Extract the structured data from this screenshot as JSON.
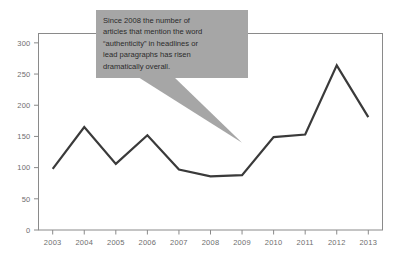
{
  "chart_data": {
    "type": "line",
    "title": "",
    "subtitle": "",
    "xlabel": "",
    "ylabel": "",
    "categories": [
      "2003",
      "2004",
      "2005",
      "2006",
      "2007",
      "2008",
      "2009",
      "2010",
      "2011",
      "2012",
      "2013"
    ],
    "values": [
      98,
      165,
      106,
      152,
      97,
      86,
      88,
      149,
      153,
      264,
      181
    ],
    "series": [
      {
        "name": "Articles mentioning \"authenticity\"",
        "values": [
          98,
          165,
          106,
          152,
          97,
          86,
          88,
          149,
          153,
          264,
          181
        ]
      }
    ],
    "x": [
      2003,
      2004,
      2005,
      2006,
      2007,
      2008,
      2009,
      2010,
      2011,
      2012,
      2013
    ],
    "ylim": [
      0,
      315
    ],
    "xlim": [
      2002.55,
      2013.45
    ],
    "yticks": [
      0,
      50,
      100,
      150,
      200,
      250,
      300
    ],
    "ytick_labels": [
      "0",
      "50",
      "100",
      "150",
      "200",
      "250",
      "300"
    ],
    "xtick_labels": [
      "2003",
      "2004",
      "2005",
      "2006",
      "2007",
      "2008",
      "2009",
      "2010",
      "2011",
      "2012",
      "2013"
    ],
    "grid": false,
    "legend": "none",
    "line_color": "#3a3a3a",
    "axis_color": "#8a8a8a",
    "tick_label_color": "#6e6e6e",
    "annotations": [
      {
        "id": "authenticity-callout",
        "kind": "callout",
        "background_color": "#a6a6a6",
        "text_color": "#2b2b2b",
        "anchor_year": 2009,
        "anchor_value": 140,
        "lines": [
          "Since  2008 the number of",
          "articles that mention the word",
          "“authenticity” in headlines or",
          "lead paragraphs has risen",
          "dramatically overall."
        ],
        "text": "Since  2008 the number of articles that mention the word “authenticity” in headlines or lead paragraphs has risen dramatically overall."
      }
    ]
  }
}
